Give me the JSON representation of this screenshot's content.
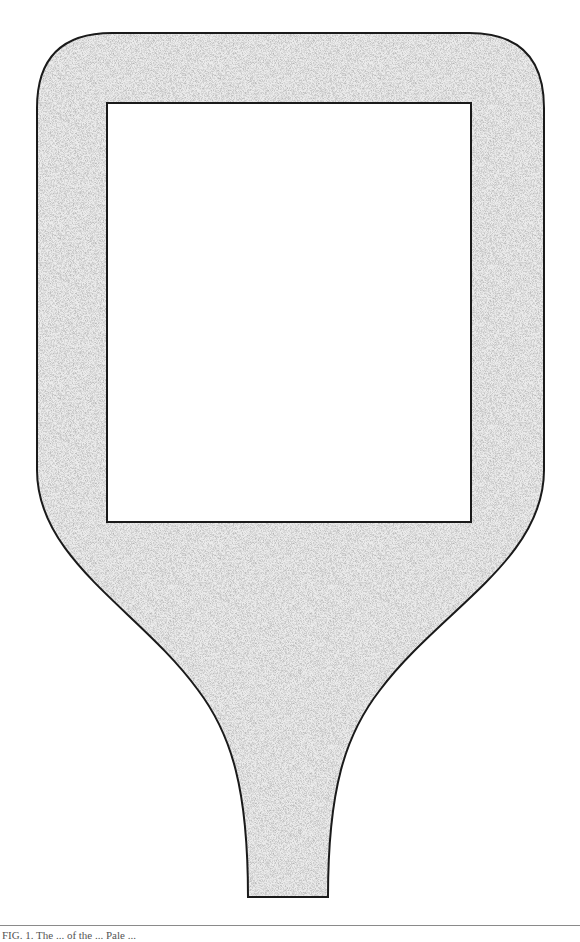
{
  "figure": {
    "fill_pattern": "stipple",
    "colors": {
      "outline": "#1a1a1a",
      "stipple_base": "#e6e6e6",
      "stipple_dots": "#7a7a7a",
      "window": "#ffffff",
      "background": "#ffffff"
    },
    "shape": {
      "outer_left": 37,
      "outer_right": 544,
      "outer_top": 33,
      "corner_radius": 75,
      "straight_sides_end_y": 470,
      "handle_top_width_y": 740,
      "handle_bottom_y": 897,
      "handle_bottom_left": 248,
      "handle_bottom_right": 328
    },
    "window": {
      "left": 107,
      "top": 103,
      "right": 471,
      "bottom": 522
    }
  },
  "caption": {
    "text": "FIG. 1. The ... of the ... Pale ..."
  }
}
